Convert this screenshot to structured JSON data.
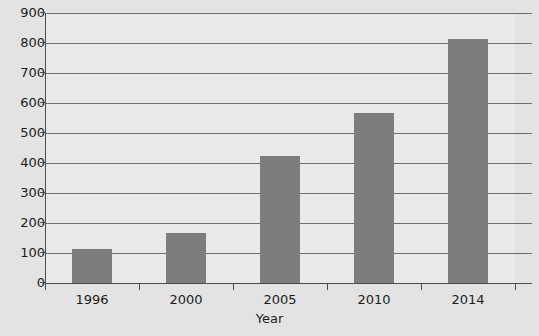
{
  "chart_data": {
    "type": "bar",
    "title": "",
    "subtitle": "",
    "xlabel": "Year",
    "ylabel": "",
    "categories": [
      "1996",
      "2000",
      "2005",
      "2010",
      "2014"
    ],
    "values": [
      112,
      168,
      425,
      568,
      815
    ],
    "series": [
      {
        "name": "",
        "values": [
          112,
          168,
          425,
          568,
          815
        ]
      }
    ],
    "ylim": [
      0,
      900
    ],
    "ytick_labels": [
      "0",
      "100",
      "200",
      "300",
      "400",
      "500",
      "600",
      "700",
      "800",
      "900"
    ],
    "ytick_values": [
      0,
      100,
      200,
      300,
      400,
      500,
      600,
      700,
      800,
      900
    ],
    "grid": true,
    "grid_axis": "y",
    "legend": false,
    "legend_position": "none",
    "annotations": []
  },
  "style": {
    "bar_color": "#7d7d7d",
    "plot_background": "#e9e9e9",
    "figure_background": "#e3e3e3",
    "gridline_color": "#6e6e6e",
    "axis_color": "#4c4c4c",
    "text_color": "#1c1c1c"
  }
}
